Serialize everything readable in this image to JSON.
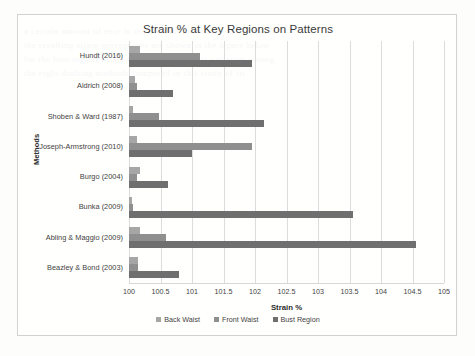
{
  "figure": {
    "title": "Strain % at Key Regions on Patterns",
    "xaxis_title": "Strain %",
    "yaxis_title": "Methods"
  },
  "legend": {
    "items": [
      {
        "label": "Back Waist",
        "color": "#a6a6a6"
      },
      {
        "label": "Front Waist",
        "color": "#8f8f8f"
      },
      {
        "label": "Bust Region",
        "color": "#6f6f6f"
      }
    ]
  },
  "background_text": [
    "a certain amount of ease is required for movement and comfort",
    "the resulting strain percentages are shown in the figure below",
    "for the bust region which exhibits the greatest variation among",
    "the eight drafting methods compared in this study of fit"
  ],
  "chart_data": {
    "type": "bar",
    "orientation": "horizontal",
    "title": "Strain % at Key Regions on Patterns",
    "xlabel": "Strain %",
    "ylabel": "Methods",
    "xlim": [
      100,
      105
    ],
    "xticks": [
      100,
      100.5,
      101,
      101.5,
      102,
      102.5,
      103,
      103.5,
      104,
      104.5,
      105
    ],
    "xtick_labels": [
      "100",
      "100.5",
      "101",
      "101.5",
      "102",
      "102.5",
      "103",
      "103.5",
      "104",
      "104.5",
      "105"
    ],
    "grid": true,
    "legend_position": "bottom",
    "categories": [
      "Hundt (2016)",
      "Aldrich (2008)",
      "Shoben & Ward (1987)",
      "Joseph-Armstrong (2010)",
      "Burgo (2004)",
      "Bunka (2009)",
      "Abling & Maggio (2009)",
      "Beazley & Bond (2003)"
    ],
    "series": [
      {
        "name": "Back Waist",
        "color": "#a6a6a6",
        "values": [
          100.18,
          100.1,
          100.06,
          100.13,
          100.17,
          100.05,
          100.18,
          100.14
        ]
      },
      {
        "name": "Front Waist",
        "color": "#8f8f8f",
        "values": [
          101.12,
          100.12,
          100.48,
          101.95,
          100.12,
          100.06,
          100.58,
          100.15
        ]
      },
      {
        "name": "Bust Region",
        "color": "#6f6f6f",
        "values": [
          101.95,
          100.7,
          102.15,
          101.0,
          100.62,
          103.55,
          104.55,
          100.79
        ]
      }
    ]
  }
}
